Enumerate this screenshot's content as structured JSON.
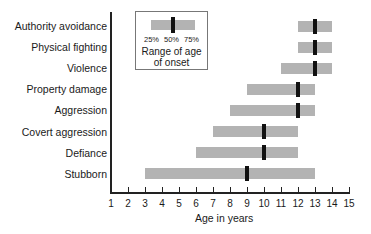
{
  "chart_data": {
    "type": "bar",
    "subtype": "horizontal range (interquartile) with median marker",
    "title": "",
    "xlabel": "Age in years",
    "ylabel": "",
    "xlim": [
      1,
      15
    ],
    "x_ticks": [
      1,
      2,
      3,
      4,
      5,
      6,
      7,
      8,
      9,
      10,
      11,
      12,
      13,
      14,
      15
    ],
    "grid": false,
    "categories": [
      "Authority avoidance",
      "Physical fighting",
      "Violence",
      "Property damage",
      "Aggression",
      "Covert aggression",
      "Defiance",
      "Stubborn"
    ],
    "series": [
      {
        "name": "25%",
        "values": [
          12,
          12,
          11,
          9,
          8,
          7,
          6,
          3
        ]
      },
      {
        "name": "50%",
        "values": [
          13,
          13,
          13,
          12,
          12,
          10,
          10,
          9
        ]
      },
      {
        "name": "75%",
        "values": [
          14,
          14,
          14,
          13,
          13,
          12,
          12,
          13
        ]
      }
    ],
    "legend": {
      "position": "top-left inside plot",
      "percentiles": [
        "25%",
        "50%",
        "75%"
      ],
      "caption": "Range of age of onset"
    },
    "colors": {
      "range_bar": "#b3b3b3",
      "median_marker": "#111111"
    }
  },
  "legend": {
    "p25": "25%",
    "p50": "50%",
    "p75": "75%",
    "line1": "Range of age",
    "line2": "of onset"
  },
  "axis": {
    "xlabel": "Age in years",
    "ticks": [
      "1",
      "2",
      "3",
      "4",
      "5",
      "6",
      "7",
      "8",
      "9",
      "10",
      "11",
      "12",
      "13",
      "14",
      "15"
    ]
  },
  "rows": [
    {
      "label": "Authority avoidance"
    },
    {
      "label": "Physical fighting"
    },
    {
      "label": "Violence"
    },
    {
      "label": "Property damage"
    },
    {
      "label": "Aggression"
    },
    {
      "label": "Covert aggression"
    },
    {
      "label": "Defiance"
    },
    {
      "label": "Stubborn"
    }
  ]
}
